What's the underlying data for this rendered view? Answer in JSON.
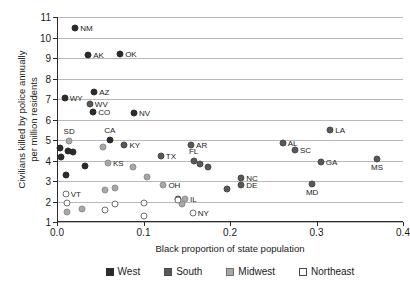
{
  "chart_data": {
    "type": "scatter",
    "title": "",
    "xlabel": "Black proportion of state population",
    "ylabel": "Civilians killed by police annually\nper million residents",
    "xlim": [
      0.0,
      0.4
    ],
    "ylim": [
      1,
      11
    ],
    "xticks": [
      "0.0",
      "0.1",
      "0.2",
      "0.3",
      "0.4"
    ],
    "xtick_values": [
      0.0,
      0.1,
      0.2,
      0.3,
      0.4
    ],
    "yticks": [
      "1",
      "2",
      "3",
      "4",
      "5",
      "6",
      "7",
      "8",
      "9",
      "10",
      "11"
    ],
    "ytick_values": [
      1,
      2,
      3,
      4,
      5,
      6,
      7,
      8,
      9,
      10,
      11
    ],
    "grid": "horizontal",
    "legend_position": "bottom",
    "legend": [
      {
        "name": "West",
        "color": "#2b2b2b",
        "marker": "filled-square-dark"
      },
      {
        "name": "South",
        "color": "#585858",
        "marker": "filled-square-medium"
      },
      {
        "name": "Midwest",
        "color": "#a8a8a8",
        "marker": "filled-square-light"
      },
      {
        "name": "Northeast",
        "color": "#ffffff",
        "marker": "open-square"
      }
    ],
    "series": [
      {
        "name": "West",
        "color": "#2b2b2b",
        "points": [
          {
            "label": "NM",
            "x": 0.021,
            "y": 10.45,
            "label_pos": "right"
          },
          {
            "label": "AK",
            "x": 0.036,
            "y": 9.15,
            "label_pos": "right"
          },
          {
            "label": "OK",
            "x": 0.073,
            "y": 9.2,
            "label_pos": "right"
          },
          {
            "label": "AZ",
            "x": 0.043,
            "y": 7.35,
            "label_pos": "right"
          },
          {
            "label": "WY",
            "x": 0.009,
            "y": 7.05,
            "label_pos": "right"
          },
          {
            "label": "CO",
            "x": 0.042,
            "y": 6.35,
            "label_pos": "right"
          },
          {
            "label": "NV",
            "x": 0.089,
            "y": 6.3,
            "label_pos": "right"
          },
          {
            "label": "CA",
            "x": 0.061,
            "y": 5.0,
            "label_pos": "above"
          },
          {
            "label": "",
            "x": 0.004,
            "y": 4.6,
            "label_pos": "none"
          },
          {
            "label": "",
            "x": 0.013,
            "y": 4.45,
            "label_pos": "none"
          },
          {
            "label": "",
            "x": 0.018,
            "y": 4.42,
            "label_pos": "none"
          },
          {
            "label": "",
            "x": 0.005,
            "y": 4.15,
            "label_pos": "none"
          },
          {
            "label": "",
            "x": 0.032,
            "y": 3.75,
            "label_pos": "none"
          },
          {
            "label": "",
            "x": 0.01,
            "y": 3.28,
            "label_pos": "none"
          }
        ]
      },
      {
        "name": "South",
        "color": "#585858",
        "points": [
          {
            "label": "LA",
            "x": 0.316,
            "y": 5.5,
            "label_pos": "right"
          },
          {
            "label": "AL",
            "x": 0.261,
            "y": 4.85,
            "label_pos": "right"
          },
          {
            "label": "SC",
            "x": 0.275,
            "y": 4.5,
            "label_pos": "right"
          },
          {
            "label": "MS",
            "x": 0.37,
            "y": 4.05,
            "label_pos": "below"
          },
          {
            "label": "GA",
            "x": 0.305,
            "y": 3.95,
            "label_pos": "right"
          },
          {
            "label": "WV",
            "x": 0.038,
            "y": 6.75,
            "label_pos": "right"
          },
          {
            "label": "KY",
            "x": 0.078,
            "y": 4.75,
            "label_pos": "right"
          },
          {
            "label": "AR",
            "x": 0.155,
            "y": 4.75,
            "label_pos": "right"
          },
          {
            "label": "TX",
            "x": 0.12,
            "y": 4.2,
            "label_pos": "right"
          },
          {
            "label": "FL",
            "x": 0.158,
            "y": 4.0,
            "label_pos": "above"
          },
          {
            "label": "",
            "x": 0.165,
            "y": 3.85,
            "label_pos": "none"
          },
          {
            "label": "",
            "x": 0.175,
            "y": 3.7,
            "label_pos": "none"
          },
          {
            "label": "NC",
            "x": 0.213,
            "y": 3.15,
            "label_pos": "right"
          },
          {
            "label": "DE",
            "x": 0.213,
            "y": 2.8,
            "label_pos": "right"
          },
          {
            "label": "MD",
            "x": 0.295,
            "y": 2.85,
            "label_pos": "below"
          },
          {
            "label": "",
            "x": 0.196,
            "y": 2.6,
            "label_pos": "none"
          },
          {
            "label": "",
            "x": 0.14,
            "y": 2.1,
            "label_pos": "none"
          }
        ]
      },
      {
        "name": "Midwest",
        "color": "#a8a8a8",
        "points": [
          {
            "label": "SD",
            "x": 0.014,
            "y": 4.95,
            "label_pos": "above"
          },
          {
            "label": "",
            "x": 0.053,
            "y": 4.65,
            "label_pos": "none"
          },
          {
            "label": "KS",
            "x": 0.059,
            "y": 3.9,
            "label_pos": "right"
          },
          {
            "label": "",
            "x": 0.088,
            "y": 3.7,
            "label_pos": "none"
          },
          {
            "label": "",
            "x": 0.104,
            "y": 3.18,
            "label_pos": "none"
          },
          {
            "label": "OH",
            "x": 0.123,
            "y": 2.8,
            "label_pos": "right"
          },
          {
            "label": "",
            "x": 0.055,
            "y": 2.55,
            "label_pos": "none"
          },
          {
            "label": "",
            "x": 0.067,
            "y": 2.65,
            "label_pos": "none"
          },
          {
            "label": "IL",
            "x": 0.148,
            "y": 2.1,
            "label_pos": "right"
          },
          {
            "label": "",
            "x": 0.144,
            "y": 1.9,
            "label_pos": "none"
          },
          {
            "label": "",
            "x": 0.012,
            "y": 1.5,
            "label_pos": "none"
          },
          {
            "label": "",
            "x": 0.029,
            "y": 1.65,
            "label_pos": "none"
          }
        ]
      },
      {
        "name": "Northeast",
        "color": "#ffffff",
        "points": [
          {
            "label": "VT",
            "x": 0.01,
            "y": 2.35,
            "label_pos": "right"
          },
          {
            "label": "",
            "x": 0.011,
            "y": 1.92,
            "label_pos": "none"
          },
          {
            "label": "",
            "x": 0.056,
            "y": 1.6,
            "label_pos": "none"
          },
          {
            "label": "",
            "x": 0.067,
            "y": 1.88,
            "label_pos": "none"
          },
          {
            "label": "",
            "x": 0.101,
            "y": 1.3,
            "label_pos": "none"
          },
          {
            "label": "",
            "x": 0.101,
            "y": 1.95,
            "label_pos": "none"
          },
          {
            "label": "",
            "x": 0.14,
            "y": 2.05,
            "label_pos": "none"
          },
          {
            "label": "NY",
            "x": 0.157,
            "y": 1.45,
            "label_pos": "right"
          }
        ]
      }
    ]
  }
}
